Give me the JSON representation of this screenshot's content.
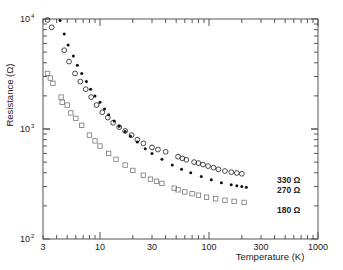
{
  "chart_data": {
    "type": "scatter",
    "title": "",
    "xlabel": "Temperature  (K)",
    "ylabel": "Resistance  (Ω)",
    "xscale": "log",
    "yscale": "log",
    "xlim": [
      3,
      1000
    ],
    "ylim": [
      100,
      10000
    ],
    "grid": false,
    "x_ticks": [
      {
        "value": 3,
        "label": "3"
      },
      {
        "value": 10,
        "label": "10"
      },
      {
        "value": 30,
        "label": "30"
      },
      {
        "value": 100,
        "label": "100"
      },
      {
        "value": 300,
        "label": "300"
      },
      {
        "value": 1000,
        "label": "1000"
      }
    ],
    "y_ticks": [
      {
        "value": 100,
        "label": "10",
        "exp": "2"
      },
      {
        "value": 1000,
        "label": "10",
        "exp": "3"
      },
      {
        "value": 10000,
        "label": "10",
        "exp": "4"
      }
    ],
    "series": [
      {
        "name": "330 Ω",
        "marker": "open-circle",
        "color": "#333333",
        "points": [
          [
            3.3,
            9800
          ],
          [
            3.6,
            8400
          ],
          [
            4.7,
            5200
          ],
          [
            5.2,
            4100
          ],
          [
            5.9,
            3200
          ],
          [
            6.6,
            2700
          ],
          [
            7.4,
            2300
          ],
          [
            8.3,
            1950
          ],
          [
            9.3,
            1650
          ],
          [
            10.5,
            1420
          ],
          [
            11.8,
            1270
          ],
          [
            13.2,
            1140
          ],
          [
            15,
            1040
          ],
          [
            17,
            960
          ],
          [
            19.5,
            880
          ],
          [
            22,
            800
          ],
          [
            25,
            740
          ],
          [
            30,
            680
          ],
          [
            34,
            650
          ],
          [
            40,
            620
          ],
          [
            52,
            560
          ],
          [
            57,
            540
          ],
          [
            62,
            525
          ],
          [
            73,
            500
          ],
          [
            80,
            490
          ],
          [
            88,
            475
          ],
          [
            98,
            460
          ],
          [
            110,
            445
          ],
          [
            122,
            430
          ],
          [
            140,
            415
          ],
          [
            160,
            405
          ],
          [
            180,
            398
          ],
          [
            200,
            392
          ]
        ]
      },
      {
        "name": "270 Ω",
        "marker": "filled-circle",
        "color": "#111111",
        "points": [
          [
            4.3,
            9700
          ],
          [
            4.7,
            7300
          ],
          [
            5.1,
            5800
          ],
          [
            5.7,
            4600
          ],
          [
            6.2,
            3800
          ],
          [
            6.8,
            3200
          ],
          [
            7.5,
            2700
          ],
          [
            8.2,
            2300
          ],
          [
            9,
            2000
          ],
          [
            10,
            1750
          ],
          [
            11,
            1520
          ],
          [
            12,
            1350
          ],
          [
            13.5,
            1180
          ],
          [
            15,
            1060
          ],
          [
            17,
            950
          ],
          [
            19,
            860
          ],
          [
            22,
            760
          ],
          [
            26,
            660
          ],
          [
            30,
            600
          ],
          [
            37,
            530
          ],
          [
            46,
            470
          ],
          [
            56,
            430
          ],
          [
            68,
            400
          ],
          [
            85,
            370
          ],
          [
            105,
            345
          ],
          [
            130,
            325
          ],
          [
            160,
            312
          ],
          [
            180,
            305
          ],
          [
            200,
            300
          ],
          [
            220,
            296
          ]
        ]
      },
      {
        "name": "180 Ω",
        "marker": "open-square",
        "color": "#777777",
        "points": [
          [
            3.3,
            3200
          ],
          [
            3.5,
            2900
          ],
          [
            3.7,
            2600
          ],
          [
            4.4,
            1950
          ],
          [
            4.5,
            1750
          ],
          [
            5,
            1650
          ],
          [
            5.4,
            1400
          ],
          [
            6,
            1250
          ],
          [
            6.8,
            1080
          ],
          [
            8,
            880
          ],
          [
            9,
            780
          ],
          [
            10,
            700
          ],
          [
            12,
            600
          ],
          [
            14,
            530
          ],
          [
            17,
            470
          ],
          [
            20,
            420
          ],
          [
            25,
            380
          ],
          [
            29,
            350
          ],
          [
            33,
            335
          ],
          [
            37,
            320
          ],
          [
            48,
            290
          ],
          [
            52,
            280
          ],
          [
            60,
            268
          ],
          [
            70,
            258
          ],
          [
            80,
            250
          ],
          [
            95,
            240
          ],
          [
            115,
            232
          ],
          [
            140,
            225
          ],
          [
            170,
            220
          ],
          [
            210,
            215
          ]
        ]
      }
    ],
    "annotations": [
      {
        "text": "330 Ω",
        "series": "330 Ω"
      },
      {
        "text": "270 Ω",
        "series": "270 Ω"
      },
      {
        "text": "180 Ω",
        "series": "180 Ω"
      }
    ]
  },
  "axes": {
    "x_title": "Temperature  (K)",
    "y_title": "Resistance  (Ω)"
  },
  "labels": {
    "s330": "330 Ω",
    "s270": "270 Ω",
    "s180": "180 Ω"
  }
}
